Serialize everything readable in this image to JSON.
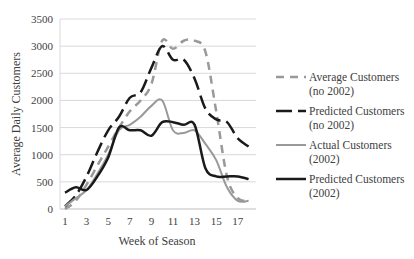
{
  "chart_data": {
    "type": "line",
    "title": "",
    "xlabel": "Week of Season",
    "ylabel": "Average Daily Customers",
    "x": [
      1,
      2,
      3,
      4,
      5,
      6,
      7,
      8,
      9,
      10,
      11,
      12,
      13,
      14,
      15,
      16,
      17,
      18
    ],
    "x_tick_labels": [
      "1",
      "3",
      "5",
      "7",
      "9",
      "11",
      "13",
      "15",
      "17"
    ],
    "y_tick_labels": [
      "0",
      "500",
      "1000",
      "1500",
      "2000",
      "2500",
      "3000",
      "3500"
    ],
    "ylim": [
      0,
      3500
    ],
    "grid": true,
    "legend_position": "right",
    "series": [
      {
        "name": "Average Customers (no 2002)",
        "label_line1": "Average Customers",
        "label_line2": "(no 2002)",
        "style": "dashed",
        "color": "#999999",
        "values": [
          0,
          150,
          450,
          800,
          1150,
          1500,
          1800,
          2000,
          2300,
          3100,
          2950,
          3100,
          3100,
          2900,
          1800,
          600,
          200,
          150
        ]
      },
      {
        "name": "Predicted Customers (no 2002)",
        "label_line1": "Predicted Customers",
        "label_line2": "(no 2002)",
        "style": "long-dash",
        "color": "#1a1a1a",
        "values": [
          50,
          250,
          600,
          1050,
          1450,
          1700,
          2050,
          2150,
          2600,
          3000,
          2750,
          2750,
          2400,
          1850,
          1650,
          1600,
          1300,
          1150
        ]
      },
      {
        "name": "Actual Customers (2002)",
        "label_line1": "Actual Customers",
        "label_line2": "(2002)",
        "style": "solid",
        "color": "#999999",
        "values": [
          50,
          200,
          350,
          650,
          1000,
          1450,
          1550,
          1700,
          1900,
          2000,
          1450,
          1400,
          1450,
          1200,
          900,
          400,
          150,
          150
        ]
      },
      {
        "name": "Predicted Customers (2002)",
        "label_line1": "Predicted Customers",
        "label_line2": "(2002)",
        "style": "solid",
        "color": "#1a1a1a",
        "values": [
          300,
          400,
          350,
          600,
          950,
          1500,
          1450,
          1450,
          1350,
          1600,
          1600,
          1550,
          1550,
          750,
          600,
          600,
          600,
          550
        ]
      }
    ]
  }
}
